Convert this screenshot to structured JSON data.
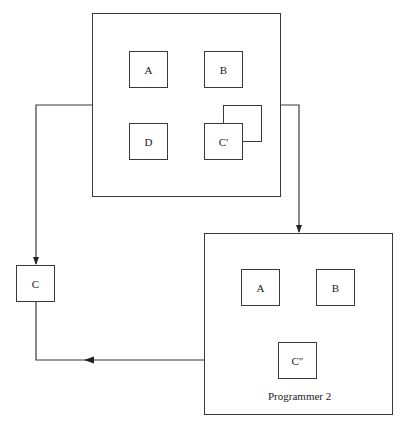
{
  "diagram": {
    "type": "code-sharing / module flow diagram",
    "top_container": {
      "label": "",
      "modules": [
        {
          "id": "A",
          "label": "A"
        },
        {
          "id": "B",
          "label": "B"
        },
        {
          "id": "D",
          "label": "D"
        },
        {
          "id": "C_prime",
          "label": "C′"
        }
      ],
      "stacked_shadow_behind": "C_prime"
    },
    "bottom_container": {
      "label": "Programmer 2",
      "modules": [
        {
          "id": "A2",
          "label": "A"
        },
        {
          "id": "B2",
          "label": "B"
        },
        {
          "id": "C_double_prime",
          "label": "C″"
        }
      ]
    },
    "external_module": {
      "id": "C",
      "label": "C"
    },
    "edges": [
      {
        "from": "top_container",
        "to": "C",
        "arrow": "down"
      },
      {
        "from": "C",
        "to": "bottom_container",
        "arrow": "left",
        "note": "line from C runs down and right to bottom container, arrowhead pointing left"
      },
      {
        "from": "top_container",
        "to": "bottom_container",
        "arrow": "down"
      }
    ],
    "colors": {
      "line": "#3a3a3a",
      "background": "#ffffff"
    }
  }
}
